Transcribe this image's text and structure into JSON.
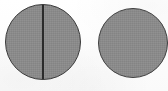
{
  "figure": {
    "caption": "",
    "background_color": "#fdfdfd",
    "width": 168,
    "height": 91,
    "shapes": [
      {
        "id": "disc-left",
        "label": "Left circle with vertical diameter line",
        "type": "circle",
        "fill_color": "#8b8b8b",
        "stroke_color": "#3a3a3a",
        "stroke_width": 1,
        "center_x": 43,
        "center_y": 42,
        "diameter": 76,
        "annotation": "vertical-diameter-line"
      },
      {
        "id": "disc-right",
        "label": "Right plain circle",
        "type": "circle",
        "fill_color": "#8b8b8b",
        "stroke_color": "#3f3f3f",
        "stroke_width": 1,
        "center_x": 133,
        "center_y": 43,
        "diameter": 70,
        "annotation": "none"
      }
    ],
    "divider": {
      "id": "divider-line",
      "label": "Vertical diameter line",
      "color": "#2b2b2b",
      "thickness": 2,
      "x": 43,
      "y_start": 5,
      "y_end": 79,
      "orientation": "vertical"
    }
  }
}
